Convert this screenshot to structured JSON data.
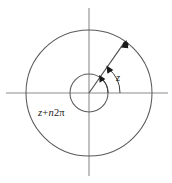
{
  "figure": {
    "name": "complex-argument-diagram",
    "background_color": "#ffffff",
    "geometry": {
      "width": 172,
      "height": 183,
      "center_x": 89,
      "center_y": 93,
      "outer_circle_radius": 63,
      "inner_circle_radius": 19,
      "ray_angle_degrees": 55,
      "ray_length": 63,
      "small_arc_radius": 19,
      "large_arc_radius": 31,
      "x_axis_start": 6,
      "x_axis_end": 168,
      "y_axis_start": 8,
      "y_axis_end": 176
    },
    "colors": {
      "axis": "#8c8c8c",
      "circle": "#5a5a5a",
      "ray": "#4a4a4a",
      "arc": "#3c3c3c",
      "marker": "#1a1a1a",
      "text": "#1a1a1a"
    },
    "labels": {
      "angle_small": {
        "full_text": "z",
        "variable": "z"
      },
      "angle_large": {
        "full_text": "z+n2π",
        "variable_z": "z",
        "operator_plus": "+",
        "variable_n": "n",
        "number_two": "2",
        "symbol_pi": "π"
      }
    },
    "elements": {
      "outer_circle_name": "outer-circle",
      "inner_circle_name": "inner-circle",
      "horizontal_axis_name": "real-axis",
      "vertical_axis_name": "imaginary-axis",
      "ray_name": "argument-ray",
      "point_name": "complex-point-marker",
      "small_arc_name": "small-angle-arc",
      "large_arc_name": "large-angle-arc"
    }
  }
}
